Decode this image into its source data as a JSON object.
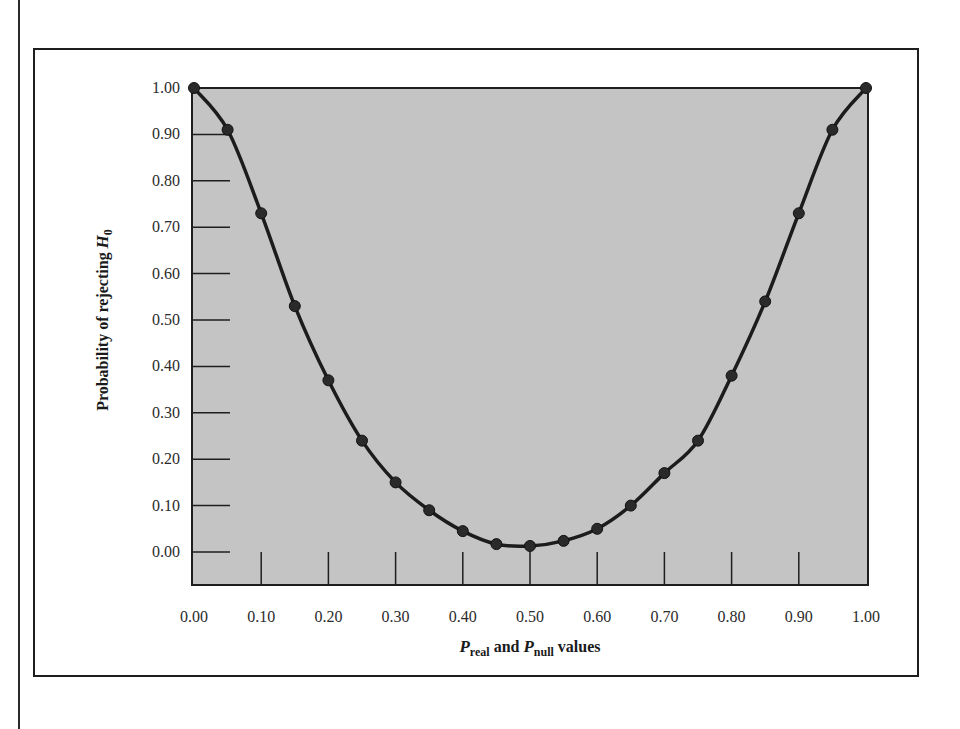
{
  "chart_data": {
    "type": "line",
    "title": "",
    "xlabel": "P_real and P_null values",
    "xlabel_parts": {
      "p1": "P",
      "sub1": "real",
      "mid": " and ",
      "p2": "P",
      "sub2": "null",
      "tail": " values"
    },
    "ylabel": "Probability of rejecting H0",
    "ylabel_parts": {
      "main": "Probability of rejecting ",
      "var": "H",
      "sub": "0"
    },
    "xlim": [
      0,
      1
    ],
    "ylim": [
      0,
      1
    ],
    "grid": false,
    "legend": null,
    "x_ticks": [
      "0.00",
      "0.10",
      "0.20",
      "0.30",
      "0.40",
      "0.50",
      "0.60",
      "0.70",
      "0.80",
      "0.90",
      "1.00"
    ],
    "y_ticks": [
      "0.00",
      "0.10",
      "0.20",
      "0.30",
      "0.40",
      "0.50",
      "0.60",
      "0.70",
      "0.80",
      "0.90",
      "1.00"
    ],
    "series": [
      {
        "name": "Power curve",
        "markers": true,
        "x": [
          0.0,
          0.05,
          0.1,
          0.15,
          0.2,
          0.25,
          0.3,
          0.35,
          0.4,
          0.45,
          0.5,
          0.55,
          0.6,
          0.65,
          0.7,
          0.75,
          0.8,
          0.85,
          0.9,
          0.95,
          1.0
        ],
        "y": [
          1.0,
          0.91,
          0.73,
          0.53,
          0.37,
          0.24,
          0.15,
          0.09,
          0.045,
          0.017,
          0.013,
          0.024,
          0.05,
          0.1,
          0.17,
          0.24,
          0.38,
          0.54,
          0.73,
          0.91,
          1.0
        ]
      }
    ],
    "colors": {
      "plot_background": "#c4c4c4",
      "line": "#1c1c1c",
      "marker": "#2a2a2a",
      "axis": "#1e1e1e"
    }
  }
}
